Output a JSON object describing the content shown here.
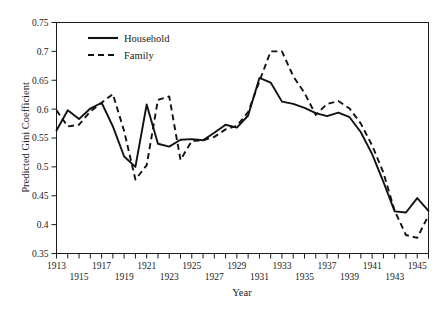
{
  "chart_data": {
    "type": "line",
    "title": "",
    "xlabel": "Year",
    "ylabel": "Predicted Gini Coefficient",
    "xlim": [
      1913,
      1946
    ],
    "ylim": [
      0.35,
      0.75
    ],
    "grid": false,
    "legend_position": "top-left",
    "yticks": [
      0.35,
      0.4,
      0.45,
      0.5,
      0.55,
      0.6,
      0.65,
      0.7,
      0.75
    ],
    "ytick_labels": [
      "0.35",
      "0.4",
      "0.45",
      "0.5",
      "0.55",
      "0.6",
      "0.65",
      "0.7",
      "0.75"
    ],
    "x": [
      1913,
      1914,
      1915,
      1916,
      1917,
      1918,
      1919,
      1920,
      1921,
      1922,
      1923,
      1924,
      1925,
      1926,
      1927,
      1928,
      1929,
      1930,
      1931,
      1932,
      1933,
      1934,
      1935,
      1936,
      1937,
      1938,
      1939,
      1940,
      1941,
      1942,
      1943,
      1944,
      1945,
      1946
    ],
    "xtick_labels_upper": [
      "1913",
      "1917",
      "1921",
      "1925",
      "1929",
      "1933",
      "1937",
      "1941",
      "1945"
    ],
    "xtick_labels_lower": [
      "1915",
      "1919",
      "1923",
      "1927",
      "1931",
      "1935",
      "1939",
      "1943"
    ],
    "series": [
      {
        "name": "Household",
        "style": "solid",
        "color": "#111111",
        "values": [
          0.563,
          0.598,
          0.583,
          0.601,
          0.611,
          0.57,
          0.518,
          0.5,
          0.608,
          0.54,
          0.535,
          0.547,
          0.548,
          0.546,
          0.559,
          0.573,
          0.568,
          0.589,
          0.654,
          0.646,
          0.613,
          0.609,
          0.602,
          0.593,
          0.588,
          0.594,
          0.586,
          0.56,
          0.522,
          0.474,
          0.423,
          0.421,
          0.446,
          0.424
        ]
      },
      {
        "name": "Family",
        "style": "dashed",
        "color": "#111111",
        "values": [
          0.598,
          0.57,
          0.573,
          0.596,
          0.611,
          0.626,
          0.562,
          0.478,
          0.503,
          0.616,
          0.622,
          0.512,
          0.545,
          0.546,
          0.552,
          0.565,
          0.571,
          0.595,
          0.648,
          0.7,
          0.7,
          0.657,
          0.628,
          0.59,
          0.609,
          0.614,
          0.601,
          0.575,
          0.537,
          0.49,
          0.424,
          0.382,
          0.377,
          0.416
        ]
      }
    ]
  },
  "legend": {
    "items": [
      {
        "label": "Household",
        "style": "solid"
      },
      {
        "label": "Family",
        "style": "dashed"
      }
    ]
  },
  "axes": {
    "y_title": "Predicted Gini Coefficient",
    "x_title": "Year"
  }
}
